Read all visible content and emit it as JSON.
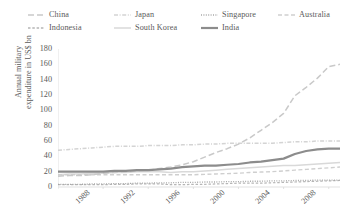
{
  "chart_data": {
    "type": "line",
    "title": "",
    "xlabel": "",
    "ylabel": "Annual military expenditure in US$ bn",
    "ylabel_line1": "Annual military",
    "ylabel_line2": "expenditure in US$ bn",
    "x": [
      1988,
      1989,
      1990,
      1991,
      1992,
      1993,
      1994,
      1995,
      1996,
      1997,
      1998,
      1999,
      2000,
      2001,
      2002,
      2003,
      2004,
      2005,
      2006,
      2007,
      2008,
      2009,
      2010,
      2011,
      2012,
      2013
    ],
    "xlim": [
      1988,
      2013
    ],
    "ylim": [
      0,
      180
    ],
    "yticks": [
      0,
      20,
      40,
      60,
      80,
      100,
      120,
      140,
      160,
      180
    ],
    "xticks": [
      1988,
      1992,
      1996,
      2000,
      2004,
      2008,
      2012
    ],
    "xtick_labels": [
      "1988",
      "1992",
      "1996",
      "2000",
      "2004",
      "2008",
      "2012"
    ],
    "ytick_labels": [
      "0",
      "20",
      "40",
      "60",
      "80",
      "100",
      "120",
      "140",
      "160",
      "180"
    ],
    "grid": false,
    "legend_position": "top",
    "series": [
      {
        "name": "China",
        "style": "long-dash",
        "color": "#c9c9c9",
        "width": 1.5,
        "values": [
          14,
          15,
          15,
          16,
          18,
          19,
          20,
          21,
          22,
          24,
          26,
          29,
          33,
          39,
          45,
          50,
          56,
          64,
          74,
          84,
          96,
          119,
          130,
          142,
          157,
          160
        ]
      },
      {
        "name": "Indonesia",
        "style": "short-dash",
        "color": "#b5b5b5",
        "width": 1.2,
        "values": [
          3,
          3,
          3,
          3,
          3,
          3.5,
          3.5,
          4,
          4,
          4,
          3,
          3,
          3.5,
          3.5,
          4,
          4.5,
          5,
          5,
          5,
          5.5,
          6,
          6.5,
          7,
          7.5,
          8,
          8.5
        ]
      },
      {
        "name": "Japan",
        "style": "dash-dot",
        "color": "#d4d4d4",
        "width": 1.5,
        "values": [
          48,
          49,
          50,
          51,
          52,
          53,
          53,
          53,
          54,
          54,
          54,
          55,
          55,
          56,
          56,
          57,
          57,
          57,
          57,
          57,
          58,
          59,
          59,
          60,
          60,
          60
        ]
      },
      {
        "name": "South Korea",
        "style": "solid-light",
        "color": "#d9d9d9",
        "width": 1.5,
        "values": [
          16,
          17,
          17,
          18,
          18,
          19,
          19,
          20,
          20,
          20,
          19,
          20,
          20,
          21,
          22,
          23,
          24,
          25,
          26,
          27,
          28,
          28,
          29,
          30,
          31,
          32
        ]
      },
      {
        "name": "Singapore",
        "style": "dotted",
        "color": "#a8a8a8",
        "width": 1.3,
        "values": [
          3.5,
          3.5,
          3.5,
          4,
          4,
          4.5,
          4.5,
          5,
          5,
          5.5,
          5.5,
          6,
          6,
          6.5,
          6.5,
          7,
          7,
          7.5,
          7.5,
          8,
          8,
          8.5,
          8.5,
          9,
          9,
          9
        ]
      },
      {
        "name": "India",
        "style": "solid-dark",
        "color": "#8c8c8c",
        "width": 2.2,
        "values": [
          20,
          20,
          20,
          20,
          20,
          21,
          21,
          22,
          22,
          23,
          24,
          26,
          27,
          28,
          28,
          29,
          30,
          32,
          33,
          35,
          37,
          43,
          47,
          49,
          50,
          50
        ]
      },
      {
        "name": "Australia",
        "style": "dash",
        "color": "#cfcfcf",
        "width": 1.4,
        "values": [
          16,
          16,
          16,
          16,
          16,
          16,
          16,
          16,
          16,
          16,
          16,
          16,
          16,
          16.5,
          17,
          17.5,
          18,
          19,
          19.5,
          20,
          21,
          22,
          23,
          24,
          25,
          26
        ]
      }
    ],
    "legend": [
      {
        "label": "China",
        "style": "long-dash",
        "color": "#c9c9c9",
        "row": 0,
        "col": 0
      },
      {
        "label": "Japan",
        "style": "dash-dot",
        "color": "#d4d4d4",
        "row": 0,
        "col": 1
      },
      {
        "label": "Singapore",
        "style": "dotted",
        "color": "#a8a8a8",
        "row": 0,
        "col": 2
      },
      {
        "label": "Australia",
        "style": "dash",
        "color": "#cfcfcf",
        "row": 0,
        "col": 3
      },
      {
        "label": "Indonesia",
        "style": "short-dash",
        "color": "#b5b5b5",
        "row": 1,
        "col": 0
      },
      {
        "label": "South Korea",
        "style": "solid-light",
        "color": "#d9d9d9",
        "row": 1,
        "col": 1
      },
      {
        "label": "India",
        "style": "solid-dark",
        "color": "#8c8c8c",
        "row": 1,
        "col": 2
      }
    ],
    "axis_color": "#d9d9d9"
  }
}
